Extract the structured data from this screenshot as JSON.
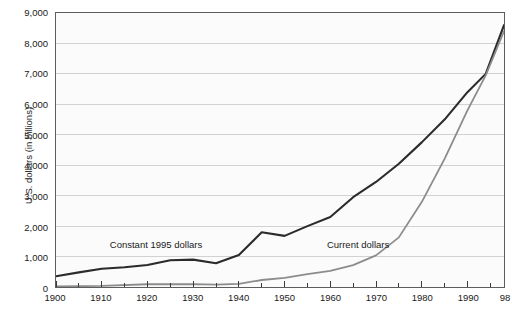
{
  "chart_data": {
    "type": "line",
    "title": "",
    "subtitle": "",
    "xlabel": "",
    "ylabel": "U.S. dollars (in billions)",
    "xlim": [
      1900,
      1998
    ],
    "ylim": [
      0,
      9000
    ],
    "grid": true,
    "legend_position": "inline-annotation",
    "ytick_labels": [
      "9,000",
      "8,000",
      "7,000",
      "6,000",
      "5,000",
      "4,000",
      "3,000",
      "2,000",
      "1,000",
      "0"
    ],
    "ytick_values": [
      9000,
      8000,
      7000,
      6000,
      5000,
      4000,
      3000,
      2000,
      1000,
      0
    ],
    "xtick_labels": [
      "1900",
      "1910",
      "1920",
      "1930",
      "1940",
      "1950",
      "1960",
      "1970",
      "1980",
      "1990",
      "98"
    ],
    "xtick_values": [
      1900,
      1910,
      1920,
      1930,
      1940,
      1950,
      1960,
      1970,
      1980,
      1990,
      1998
    ],
    "xminor_ticks": [
      1905,
      1915,
      1925,
      1935,
      1945,
      1955,
      1965,
      1975,
      1985,
      1995
    ],
    "series": [
      {
        "name": "Constant 1995 dollars",
        "color": "#2b2b2b",
        "annotation_x": 1922,
        "annotation_y": 1450,
        "x": [
          1900,
          1905,
          1910,
          1915,
          1920,
          1925,
          1930,
          1935,
          1940,
          1945,
          1950,
          1955,
          1960,
          1965,
          1970,
          1975,
          1980,
          1985,
          1990,
          1994,
          1998
        ],
        "values": [
          350,
          480,
          600,
          650,
          720,
          880,
          900,
          780,
          1050,
          1800,
          1680,
          2000,
          2300,
          2950,
          3450,
          4050,
          4750,
          5500,
          6400,
          7000,
          8600
        ]
      },
      {
        "name": "Current dollars",
        "color": "#8c8c8c",
        "annotation_x": 1966,
        "annotation_y": 1430,
        "x": [
          1900,
          1910,
          1920,
          1930,
          1935,
          1940,
          1945,
          1950,
          1955,
          1960,
          1965,
          1970,
          1975,
          1980,
          1985,
          1990,
          1994,
          1998
        ],
        "values": [
          20,
          35,
          90,
          95,
          75,
          105,
          230,
          300,
          420,
          530,
          720,
          1040,
          1630,
          2790,
          4210,
          5800,
          6950,
          8400
        ]
      }
    ]
  }
}
